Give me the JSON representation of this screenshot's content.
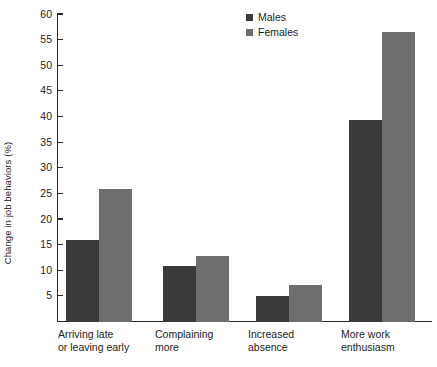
{
  "chart_data": {
    "type": "bar",
    "title": "",
    "xlabel": "",
    "ylabel": "Change in job behaviors (%)",
    "categories": [
      "Arriving late\nor leaving early",
      "Complaining\nmore",
      "Increased\nabsence",
      "More work\nenthusiasm"
    ],
    "series": [
      {
        "name": "Males",
        "color": "#3a3a3a",
        "values": [
          16,
          11,
          5,
          39.5
        ]
      },
      {
        "name": "Females",
        "color": "#6e6e6e",
        "values": [
          26,
          12.8,
          7.3,
          56.5
        ]
      }
    ],
    "ylim": [
      0,
      60
    ],
    "yticks": [
      5,
      10,
      15,
      20,
      25,
      30,
      35,
      40,
      45,
      50,
      55,
      60
    ],
    "ytick_labels": [
      "5",
      "10",
      "15",
      "20",
      "25",
      "30",
      "35",
      "40",
      "45",
      "50",
      "55",
      "60"
    ],
    "grid": false,
    "legend_position": "top-center"
  }
}
